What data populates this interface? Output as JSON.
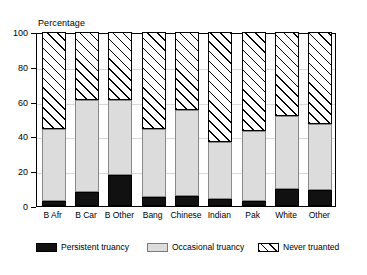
{
  "chart_data": {
    "type": "bar",
    "subtype": "stacked-bar-100",
    "title": "",
    "xlabel": "",
    "ylabel": "Percentage",
    "ylim": [
      0,
      100
    ],
    "yticks": [
      0,
      20,
      40,
      60,
      80,
      100
    ],
    "ytick_labels": [
      "0",
      "20",
      "40",
      "60",
      "80",
      "100"
    ],
    "grid": true,
    "legend_position": "bottom",
    "categories": [
      "B Afr",
      "B Car",
      "B Other",
      "Bang",
      "Chinese",
      "Indian",
      "Pak",
      "White",
      "Other"
    ],
    "series": [
      {
        "name": "Persistent truancy",
        "pattern": "solid-black",
        "color": "#111111",
        "values": [
          3,
          8,
          18,
          5,
          6,
          4,
          3,
          10,
          9
        ]
      },
      {
        "name": "Occasional truancy",
        "pattern": "solid-light-grey",
        "color": "#dcdcdc",
        "values": [
          41,
          53,
          43,
          39,
          49,
          33,
          40,
          42,
          38
        ]
      },
      {
        "name": "Never truanted",
        "pattern": "diagonal-hatch",
        "color": "#ffffff",
        "values": [
          56,
          39,
          39,
          56,
          45,
          63,
          57,
          48,
          53
        ]
      }
    ],
    "cumulative_tops": {
      "persistent": [
        3,
        8,
        18,
        5,
        6,
        4,
        3,
        10,
        9
      ],
      "occasional": [
        44,
        61,
        61,
        44,
        55,
        37,
        43,
        52,
        47
      ],
      "never": [
        100,
        100,
        100,
        100,
        100,
        100,
        100,
        100,
        100
      ]
    }
  },
  "legend": {
    "items": [
      {
        "label": "Persistent truancy",
        "swatch": "solid-black-swatch"
      },
      {
        "label": "Occasional truancy",
        "swatch": "light-grey-swatch"
      },
      {
        "label": "Never truanted",
        "swatch": "hatched-swatch"
      }
    ]
  }
}
